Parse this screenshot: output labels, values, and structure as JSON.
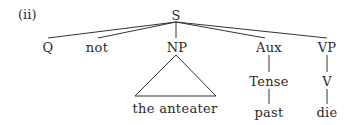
{
  "example_label": "(ii)",
  "tree": {
    "root": "S",
    "children": [
      {
        "label": "Q"
      },
      {
        "label": "not"
      },
      {
        "label": "NP",
        "triangle": "the anteater"
      },
      {
        "label": "Aux",
        "children": [
          {
            "label": "Tense",
            "children": [
              {
                "label": "past"
              }
            ]
          }
        ]
      },
      {
        "label": "VP",
        "children": [
          {
            "label": "V",
            "children": [
              {
                "label": "die"
              }
            ]
          }
        ]
      }
    ]
  },
  "nodes": {
    "s": "S",
    "q": "Q",
    "not": "not",
    "np": "NP",
    "np_leaf": "the anteater",
    "aux": "Aux",
    "tense": "Tense",
    "past": "past",
    "vp": "VP",
    "v": "V",
    "die": "die"
  }
}
